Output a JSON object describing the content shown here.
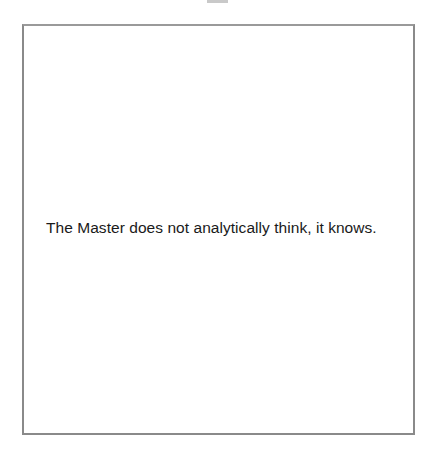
{
  "card": {
    "text": "The Master does not analytically think, it knows."
  },
  "colors": {
    "border": "#8a8a8a",
    "text": "#1a1a1a",
    "background": "#ffffff",
    "top_tab": "#c9c9c9"
  }
}
